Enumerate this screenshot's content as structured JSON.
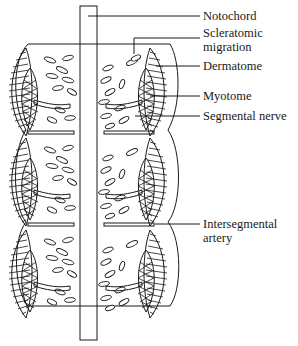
{
  "figure": {
    "type": "diagram",
    "segment_count": 3
  },
  "labels": [
    {
      "id": "notochord",
      "lines": [
        "Notochord"
      ]
    },
    {
      "id": "scleratomic-migration",
      "lines": [
        "Scleratomic",
        "migration"
      ]
    },
    {
      "id": "dermatome",
      "lines": [
        "Dermatome"
      ]
    },
    {
      "id": "myotome",
      "lines": [
        "Myotome"
      ]
    },
    {
      "id": "segmental-nerve",
      "lines": [
        "Segmental nerve"
      ]
    },
    {
      "id": "intersegmental-artery",
      "lines": [
        "Intersegmental",
        "artery"
      ]
    }
  ],
  "colors": {
    "line": "#1a1a1a",
    "background": "#ffffff"
  }
}
